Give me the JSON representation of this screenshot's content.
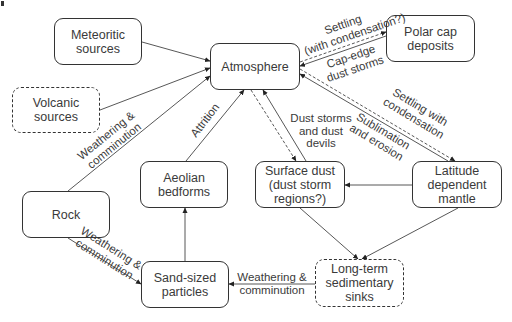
{
  "nodes": {
    "meteoritic": {
      "label": "Meteoritic\nsources",
      "style": "solid"
    },
    "volcanic": {
      "label": "Volcanic\nsources",
      "style": "dashed"
    },
    "atmosphere": {
      "label": "Atmosphere",
      "style": "solid"
    },
    "polar_cap": {
      "label": "Polar cap\ndeposits",
      "style": "solid"
    },
    "aeolian": {
      "label": "Aeolian\nbedforms",
      "style": "solid"
    },
    "surface_dust": {
      "label": "Surface dust\n(dust storm\nregions?)",
      "style": "solid"
    },
    "latitude_mantle": {
      "label": "Latitude\ndependent\nmantle",
      "style": "solid"
    },
    "rock": {
      "label": "Rock",
      "style": "solid"
    },
    "sand": {
      "label": "Sand-sized\nparticles",
      "style": "solid"
    },
    "sinks": {
      "label": "Long-term\nsedimentary\nsinks",
      "style": "dashed"
    }
  },
  "edge_labels": {
    "polar_settling": "Settling\n(with condensation?)",
    "polar_storms": "Cap-edge\ndust storms",
    "mantle_settling": "Settling with\ncondensation",
    "mantle_sublimation": "Sublimation\nand erosion",
    "dust_storms": "Dust storms\nand dust\ndevils",
    "attrition": "Attrition",
    "rock_to_atmosphere": "Weathering &\ncomminution",
    "rock_to_sand": "Weathering &\ncomminution",
    "sinks_to_sand": "Weathering &\ncomminution"
  },
  "edges": [
    {
      "from": "Meteoritic sources",
      "to": "Atmosphere",
      "style": "solid"
    },
    {
      "from": "Volcanic sources",
      "to": "Atmosphere",
      "style": "solid"
    },
    {
      "from": "Rock",
      "to": "Atmosphere",
      "style": "solid",
      "label": "Weathering & comminution"
    },
    {
      "from": "Aeolian bedforms",
      "to": "Atmosphere",
      "style": "solid",
      "label": "Attrition"
    },
    {
      "from": "Atmosphere",
      "to": "Surface dust",
      "style": "dashed"
    },
    {
      "from": "Surface dust",
      "to": "Atmosphere",
      "style": "solid",
      "label": "Dust storms and dust devils"
    },
    {
      "from": "Atmosphere",
      "to": "Polar cap deposits",
      "style": "dashed",
      "label": "Settling (with condensation?)"
    },
    {
      "from": "Polar cap deposits",
      "to": "Atmosphere",
      "style": "solid",
      "label": "Cap-edge dust storms"
    },
    {
      "from": "Atmosphere",
      "to": "Latitude dependent mantle",
      "style": "dashed",
      "label": "Settling with condensation"
    },
    {
      "from": "Latitude dependent mantle",
      "to": "Atmosphere",
      "style": "solid",
      "label": "Sublimation and erosion"
    },
    {
      "from": "Latitude dependent mantle",
      "to": "Surface dust",
      "style": "solid"
    },
    {
      "from": "Surface dust",
      "to": "Long-term sedimentary sinks",
      "style": "solid"
    },
    {
      "from": "Latitude dependent mantle",
      "to": "Long-term sedimentary sinks",
      "style": "solid"
    },
    {
      "from": "Long-term sedimentary sinks",
      "to": "Sand-sized particles",
      "style": "solid",
      "label": "Weathering & comminution"
    },
    {
      "from": "Rock",
      "to": "Sand-sized particles",
      "style": "solid",
      "label": "Weathering & comminution"
    },
    {
      "from": "Sand-sized particles",
      "to": "Aeolian bedforms",
      "style": "solid"
    }
  ]
}
